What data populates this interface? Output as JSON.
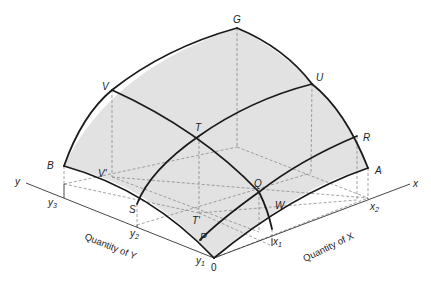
{
  "diagram": {
    "type": "3d-production-possibility-surface",
    "colors": {
      "surface_fill": "#e2e2e2",
      "curve_stroke": "#1a1a1a",
      "dashed_stroke": "#8a8a8a",
      "axis_stroke": "#333333",
      "background": "#ffffff"
    },
    "points": {
      "G": "G",
      "U": "U",
      "R": "R",
      "A": "A",
      "V": "V",
      "T": "T",
      "Q": "Q",
      "W": "W",
      "B": "B",
      "S": "S",
      "P": "P",
      "O": "0",
      "V_prime": "V'",
      "T_prime": "T'"
    },
    "axes": {
      "x": {
        "label": "x",
        "title": "Quantity of X",
        "ticks": [
          "x",
          "x"
        ],
        "tick_subs": [
          "1",
          "2"
        ]
      },
      "y": {
        "label": "y",
        "title": "Quantity of Y",
        "ticks": [
          "y",
          "y",
          "y"
        ],
        "tick_subs": [
          "1",
          "2",
          "3"
        ]
      }
    }
  }
}
